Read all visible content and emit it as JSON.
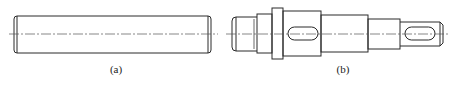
{
  "figures": [
    {
      "id": "a",
      "label": "(a)",
      "description": "plain cylindrical pin with chamfered ends"
    },
    {
      "id": "b",
      "label": "(b)",
      "description": "stepped shaft with collar, threaded end and two keyways"
    }
  ],
  "colors": {
    "line": "#2a2a2a",
    "centerline": "#555555",
    "background": "#ffffff"
  }
}
